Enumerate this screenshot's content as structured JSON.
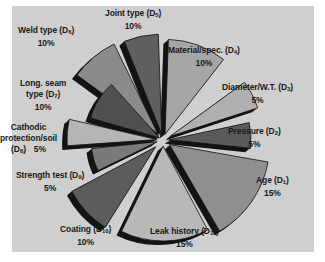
{
  "chart_data": {
    "type": "pie",
    "title": "",
    "style": "3d-exploded",
    "center": [
      163,
      140
    ],
    "slices": [
      {
        "label": "Age",
        "code": "D",
        "sub": "1",
        "value": 15,
        "pct_label": "15%",
        "start": 100,
        "end": 150,
        "r": 100,
        "fill": "#8f8f8f",
        "explode": 8
      },
      {
        "label": "Pressure",
        "code": "D",
        "sub": "2",
        "value": 5,
        "pct_label": "5%",
        "start": 78,
        "end": 96,
        "r": 82,
        "fill": "#5a5a5a",
        "explode": 6
      },
      {
        "label": "Diameter/W.T.",
        "code": "D",
        "sub": "3",
        "value": 5,
        "pct_label": "5%",
        "start": 54,
        "end": 72,
        "r": 92,
        "fill": "#b0b0b0",
        "explode": 8
      },
      {
        "label": "Material/spec.",
        "code": "D",
        "sub": "4",
        "value": 10,
        "pct_label": "10%",
        "start": 2,
        "end": 38,
        "r": 95,
        "fill": "#a6a6a6",
        "explode": 6
      },
      {
        "label": "Joint type",
        "code": "D",
        "sub": "5",
        "value": 10,
        "pct_label": "10%",
        "start": 338,
        "end": 358,
        "r": 100,
        "fill": "#5f5f5f",
        "explode": 6
      },
      {
        "label": "Weld type",
        "code": "D",
        "sub": "6",
        "value": 10,
        "pct_label": "10%",
        "start": 306,
        "end": 334,
        "r": 100,
        "fill": "#8a8a8a",
        "explode": 8
      },
      {
        "label": "Long. seam type",
        "code": "D",
        "sub": "7",
        "value": 10,
        "pct_label": "10%",
        "start": 286,
        "end": 318,
        "r": 72,
        "fill": "#505050",
        "explode": 4
      },
      {
        "label": "Cathodic protection/soil",
        "code": "D",
        "sub": "8",
        "value": 5,
        "pct_label": "5%",
        "start": 266,
        "end": 283,
        "r": 90,
        "fill": "#b5b5b5",
        "explode": 6
      },
      {
        "label": "Strength test",
        "code": "D",
        "sub": "9",
        "value": 5,
        "pct_label": "5%",
        "start": 244,
        "end": 264,
        "r": 66,
        "fill": "#7a7a7a",
        "explode": 6
      },
      {
        "label": "Coating",
        "code": "D",
        "sub": "10",
        "value": 10,
        "pct_label": "10%",
        "start": 212,
        "end": 242,
        "r": 95,
        "fill": "#5c5c5c",
        "explode": 10
      },
      {
        "label": "Leak history",
        "code": "D",
        "sub": "11",
        "value": 15,
        "pct_label": "15%",
        "start": 152,
        "end": 206,
        "r": 95,
        "fill": "#b8b8b8",
        "explode": 6
      }
    ],
    "depth_color": "#141414",
    "depth": 9,
    "legend": "none"
  },
  "labels": [
    {
      "name": "label-joint-type",
      "text": "Joint type (D",
      "sub": "5",
      "close": ")",
      "pct": "10%",
      "x": 105,
      "y": 8
    },
    {
      "name": "label-weld-type",
      "text": "Weld type (D",
      "sub": "6",
      "close": ")",
      "pct": "10%",
      "x": 18,
      "y": 25
    },
    {
      "name": "label-material-spec",
      "text": "Material/spec. (D",
      "sub": "4",
      "close": ")",
      "pct": "10%",
      "x": 168,
      "y": 45
    },
    {
      "name": "label-diameter-wt",
      "text": "Diameter/W.T. (D",
      "sub": "3",
      "close": ")",
      "pct": "5%",
      "x": 222,
      "y": 82
    },
    {
      "name": "label-long-seam",
      "text": "Long. seam",
      "line2": "type (D",
      "sub": "7",
      "close": ")",
      "pct": "10%",
      "x": 20,
      "y": 78
    },
    {
      "name": "label-cathodic",
      "text": "Cathodic",
      "line2": "protection/soil",
      "line3": "(D",
      "sub": "8",
      "close": ")",
      "pct": "5%",
      "x": 0,
      "y": 122
    },
    {
      "name": "label-pressure",
      "text": "Pressure (D",
      "sub": "2",
      "close": ")",
      "pct": "5%",
      "x": 228,
      "y": 126
    },
    {
      "name": "label-strength-test",
      "text": "Strength test (D",
      "sub": "9",
      "close": ")",
      "pct": "5%",
      "x": 16,
      "y": 170
    },
    {
      "name": "label-age",
      "text": "Age (D",
      "sub": "1",
      "close": ")",
      "pct": "15%",
      "x": 256,
      "y": 175
    },
    {
      "name": "label-coating",
      "text": "Coating (D",
      "sub": "10",
      "close": ")",
      "pct": "10%",
      "x": 60,
      "y": 224
    },
    {
      "name": "label-leak-history",
      "text": "Leak history (D",
      "sub": "11",
      "close": ")",
      "pct": "15%",
      "x": 150,
      "y": 226
    }
  ]
}
